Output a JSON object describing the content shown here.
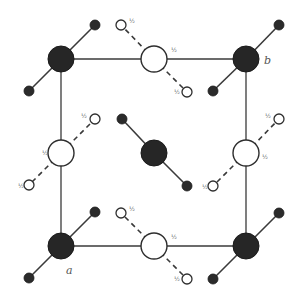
{
  "diagram": {
    "corner_labels": {
      "a": "a",
      "b": "b"
    },
    "height_label": "½",
    "colors": {
      "dark_atom": "#262626",
      "open_atom": "#ffffff",
      "line": "#3a3a3a",
      "label": "#555555"
    },
    "cell": {
      "x1": 61,
      "y1": 59,
      "x2": 246,
      "y2": 246
    },
    "dark_groups": [
      {
        "id": "top-left",
        "center": [
          61,
          59
        ],
        "sats": [
          [
            95,
            25
          ],
          [
            29,
            91
          ]
        ]
      },
      {
        "id": "top-right",
        "center": [
          246,
          59
        ],
        "sats": [
          [
            279,
            25
          ],
          [
            213,
            91
          ]
        ]
      },
      {
        "id": "bottom-left",
        "center": [
          61,
          246
        ],
        "sats": [
          [
            95,
            212
          ],
          [
            29,
            278
          ]
        ]
      },
      {
        "id": "bottom-right",
        "center": [
          246,
          246
        ],
        "sats": [
          [
            279,
            213
          ],
          [
            213,
            279
          ]
        ]
      },
      {
        "id": "center",
        "center": [
          154,
          153
        ],
        "sats": [
          [
            122,
            119
          ],
          [
            187,
            186
          ]
        ]
      }
    ],
    "open_groups": [
      {
        "id": "top-mid",
        "center": [
          154,
          59
        ],
        "sats": [
          [
            121,
            25
          ],
          [
            187,
            92
          ]
        ]
      },
      {
        "id": "bottom-mid",
        "center": [
          154,
          246
        ],
        "sats": [
          [
            121,
            213
          ],
          [
            187,
            279
          ]
        ]
      },
      {
        "id": "left-mid",
        "center": [
          61,
          153
        ],
        "sats": [
          [
            95,
            119
          ],
          [
            29,
            185
          ]
        ]
      },
      {
        "id": "right-mid",
        "center": [
          246,
          153
        ],
        "sats": [
          [
            279,
            119
          ],
          [
            213,
            186
          ]
        ]
      }
    ]
  }
}
